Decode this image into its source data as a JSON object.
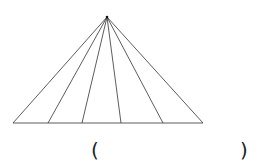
{
  "diagram": {
    "apex": [
      107,
      17
    ],
    "base_y": 123,
    "base_points_x": [
      13,
      48,
      82,
      121,
      163,
      203
    ],
    "stroke_color": "#333333"
  },
  "answer_blank": {
    "open": "(",
    "close": ")"
  }
}
